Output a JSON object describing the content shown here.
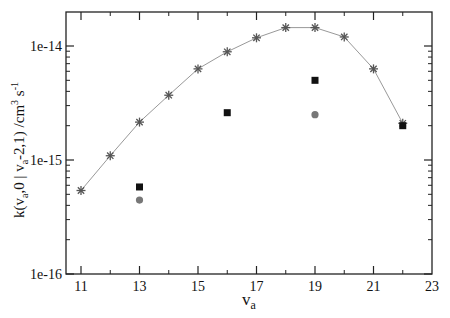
{
  "chart_data": {
    "type": "scatter",
    "title": "",
    "xlabel": "v_a",
    "xlabel_main": "v",
    "xlabel_sub": "a",
    "ylabel": "k(v_a,0 | v_a-2,1) /cm^3 s^-1",
    "ylabel_parts": {
      "pre": "k(v",
      "sub1": "a",
      "mid": ",0 | v",
      "sub2": "a",
      "post": "-2,1)  /cm",
      "sup1": "3",
      "post2": " s",
      "sup2": "-1"
    },
    "xlim": [
      10.5,
      23
    ],
    "ylim": [
      1e-16,
      2e-14
    ],
    "yscale": "log",
    "grid": false,
    "legend": null,
    "x_ticks": [
      11,
      13,
      15,
      17,
      19,
      21,
      23
    ],
    "x_tick_labels": [
      "11",
      "13",
      "15",
      "17",
      "19",
      "21",
      "23"
    ],
    "x_minor_ticks": [
      12,
      14,
      16,
      18,
      20,
      22
    ],
    "y_ticks": [
      1e-16,
      1e-15,
      1e-14
    ],
    "y_tick_labels": [
      "1e-16",
      "1e-15",
      "1e-14"
    ],
    "series": [
      {
        "name": "calculated",
        "marker": "asterisk",
        "line": true,
        "color": "#555555",
        "line_color": "#999999",
        "x": [
          11,
          12,
          13,
          14,
          15,
          16,
          17,
          18,
          19,
          20,
          21,
          22
        ],
        "values": [
          5.4e-16,
          1.09e-15,
          2.15e-15,
          3.7e-15,
          6.3e-15,
          8.9e-15,
          1.18e-14,
          1.45e-14,
          1.45e-14,
          1.2e-14,
          6.3e-15,
          2.1e-15
        ]
      },
      {
        "name": "experiment-squares",
        "marker": "square",
        "line": false,
        "color": "#111111",
        "x": [
          13,
          16,
          19,
          22
        ],
        "values": [
          5.8e-16,
          2.6e-15,
          5e-15,
          2e-15
        ]
      },
      {
        "name": "experiment-circles",
        "marker": "circle",
        "line": false,
        "color": "#777777",
        "x": [
          13,
          19
        ],
        "values": [
          4.45e-16,
          2.5e-15
        ]
      }
    ]
  },
  "layout": {
    "plot_left": 66,
    "plot_right": 432,
    "plot_top": 12,
    "plot_bottom": 274,
    "x_px_per_unit": 29.25,
    "x_origin_value": 11,
    "x_origin_px": 81,
    "y_px_per_decade": 114,
    "y_ref_log": -16,
    "y_ref_px": 274
  }
}
